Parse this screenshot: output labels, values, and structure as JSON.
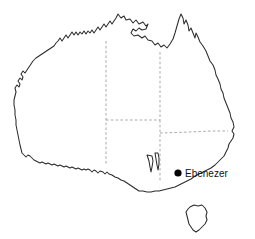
{
  "map": {
    "title": "Australia",
    "background_color": "#ffffff",
    "coast_stroke_color": "#2b2b2b",
    "border_stroke_color": "#9a9a9a",
    "marker_color": "#000000",
    "label_color": "#111111",
    "projection_note": "outline locator map",
    "landmasses": [
      {
        "name": "mainland-australia"
      },
      {
        "name": "tasmania"
      }
    ],
    "internal_borders": [
      {
        "name": "wa-nt-sa-border-vertical"
      },
      {
        "name": "nt-sa-qld-border-horizontal"
      },
      {
        "name": "nt-qld-border-vertical"
      },
      {
        "name": "sa-nsw-vic-border-vertical"
      },
      {
        "name": "qld-nsw-border-horizontal"
      }
    ],
    "markers": [
      {
        "name": "ebenezer",
        "label": "Ebenezer",
        "dot_radius": 3.6,
        "x": 178,
        "y": 173,
        "label_x": 185,
        "label_y": 173
      }
    ]
  }
}
